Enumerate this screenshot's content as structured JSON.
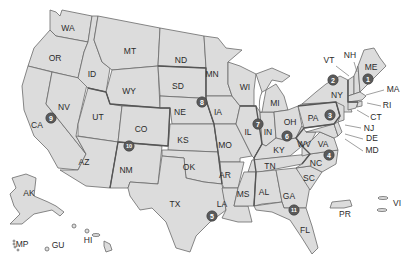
{
  "map": {
    "title": "",
    "fill_color": "#dcdcdc",
    "border_color": "#6a6a6a",
    "marker_color": "#5a5a5a",
    "states": [
      {
        "code": "WA",
        "x": 68,
        "y": 29
      },
      {
        "code": "OR",
        "x": 55,
        "y": 59
      },
      {
        "code": "ID",
        "x": 92,
        "y": 75
      },
      {
        "code": "MT",
        "x": 130,
        "y": 52
      },
      {
        "code": "WY",
        "x": 129,
        "y": 92
      },
      {
        "code": "CA",
        "x": 37,
        "y": 126
      },
      {
        "code": "NV",
        "x": 64,
        "y": 108
      },
      {
        "code": "UT",
        "x": 98,
        "y": 118
      },
      {
        "code": "CO",
        "x": 141,
        "y": 130
      },
      {
        "code": "AZ",
        "x": 84,
        "y": 163
      },
      {
        "code": "NM",
        "x": 126,
        "y": 171
      },
      {
        "code": "ND",
        "x": 181,
        "y": 61
      },
      {
        "code": "SD",
        "x": 178,
        "y": 87
      },
      {
        "code": "NE",
        "x": 180,
        "y": 113
      },
      {
        "code": "KS",
        "x": 183,
        "y": 141
      },
      {
        "code": "OK",
        "x": 189,
        "y": 168
      },
      {
        "code": "TX",
        "x": 175,
        "y": 205
      },
      {
        "code": "MN",
        "x": 212,
        "y": 75
      },
      {
        "code": "IA",
        "x": 218,
        "y": 113
      },
      {
        "code": "MO",
        "x": 225,
        "y": 146
      },
      {
        "code": "AR",
        "x": 225,
        "y": 176
      },
      {
        "code": "LA",
        "x": 222,
        "y": 205
      },
      {
        "code": "WI",
        "x": 245,
        "y": 88
      },
      {
        "code": "IL",
        "x": 248,
        "y": 133
      },
      {
        "code": "MI",
        "x": 275,
        "y": 104
      },
      {
        "code": "IN",
        "x": 268,
        "y": 133
      },
      {
        "code": "OH",
        "x": 290,
        "y": 123
      },
      {
        "code": "KY",
        "x": 279,
        "y": 151
      },
      {
        "code": "TN",
        "x": 270,
        "y": 167
      },
      {
        "code": "MS",
        "x": 243,
        "y": 195
      },
      {
        "code": "AL",
        "x": 264,
        "y": 193
      },
      {
        "code": "GA",
        "x": 289,
        "y": 197
      },
      {
        "code": "FL",
        "x": 305,
        "y": 231
      },
      {
        "code": "SC",
        "x": 309,
        "y": 179
      },
      {
        "code": "NC",
        "x": 316,
        "y": 164
      },
      {
        "code": "VA",
        "x": 323,
        "y": 145
      },
      {
        "code": "WV",
        "x": 304,
        "y": 145
      },
      {
        "code": "PA",
        "x": 313,
        "y": 119
      },
      {
        "code": "NY",
        "x": 337,
        "y": 96
      },
      {
        "code": "ME",
        "x": 371,
        "y": 68
      },
      {
        "code": "AK",
        "x": 29,
        "y": 194
      },
      {
        "code": "HI",
        "x": 88,
        "y": 241
      }
    ],
    "callout_labels": [
      {
        "code": "VT",
        "x": 329,
        "y": 61,
        "lx1": 336,
        "ly1": 66,
        "lx2": 349,
        "ly2": 76
      },
      {
        "code": "NH",
        "x": 350,
        "y": 56,
        "lx1": 354,
        "ly1": 62,
        "lx2": 357,
        "ly2": 72
      },
      {
        "code": "MA",
        "x": 393,
        "y": 90,
        "lx1": 384,
        "ly1": 90,
        "lx2": 366,
        "ly2": 95
      },
      {
        "code": "RI",
        "x": 387,
        "y": 106,
        "lx1": 381,
        "ly1": 106,
        "lx2": 367,
        "ly2": 103
      },
      {
        "code": "CT",
        "x": 376,
        "y": 118,
        "lx1": 369,
        "ly1": 117,
        "lx2": 357,
        "ly2": 110
      },
      {
        "code": "NJ",
        "x": 369,
        "y": 129,
        "lx1": 361,
        "ly1": 128,
        "lx2": 345,
        "ly2": 125
      },
      {
        "code": "DE",
        "x": 372,
        "y": 139,
        "lx1": 363,
        "ly1": 139,
        "lx2": 345,
        "ly2": 134
      },
      {
        "code": "MD",
        "x": 372,
        "y": 151,
        "lx1": 363,
        "ly1": 151,
        "lx2": 345,
        "ly2": 139
      }
    ],
    "territories": [
      {
        "code": "PR",
        "x": 345,
        "y": 215
      },
      {
        "code": "VI",
        "x": 397,
        "y": 204
      },
      {
        "code": "MP",
        "x": 22,
        "y": 245
      },
      {
        "code": "GU",
        "x": 58,
        "y": 246
      }
    ],
    "markers": [
      {
        "num": "1",
        "x": 368,
        "y": 79
      },
      {
        "num": "2",
        "x": 333,
        "y": 80
      },
      {
        "num": "3",
        "x": 330,
        "y": 115
      },
      {
        "num": "4",
        "x": 329,
        "y": 155
      },
      {
        "num": "5",
        "x": 212,
        "y": 216
      },
      {
        "num": "6",
        "x": 287,
        "y": 136
      },
      {
        "num": "7",
        "x": 258,
        "y": 124
      },
      {
        "num": "8",
        "x": 202,
        "y": 102
      },
      {
        "num": "9",
        "x": 51,
        "y": 118
      },
      {
        "num": "10",
        "x": 129,
        "y": 146
      },
      {
        "num": "11",
        "x": 294,
        "y": 210
      }
    ]
  }
}
